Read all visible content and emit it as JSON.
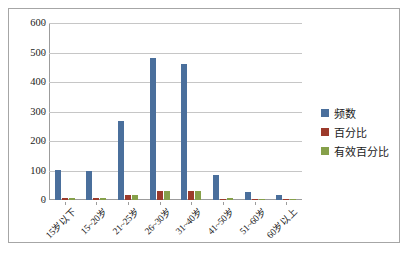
{
  "chart_data": {
    "type": "bar",
    "title": "",
    "subtitle": "",
    "xlabel": "",
    "ylabel": "",
    "ylim": [
      0,
      600
    ],
    "ytick_values": [
      0,
      100,
      200,
      300,
      400,
      500,
      600
    ],
    "ytick_labels": [
      "0",
      "100",
      "200",
      "300",
      "400",
      "500",
      "600"
    ],
    "grid": true,
    "legend_position": "right",
    "categories": [
      "15岁以下",
      "15~20岁",
      "21~25岁",
      "26~30岁",
      "31~40岁",
      "41~50岁",
      "51~60岁",
      "60岁以上"
    ],
    "series": [
      {
        "name": "频数",
        "color": "#4a6f9c",
        "values": [
          103,
          97,
          268,
          482,
          460,
          85,
          27,
          18
        ]
      },
      {
        "name": "百分比",
        "color": "#9c3a2b",
        "values": [
          6,
          6,
          17,
          31,
          30,
          5,
          2,
          1
        ]
      },
      {
        "name": "有效百分比",
        "color": "#86a04a",
        "values": [
          7,
          6,
          18,
          32,
          30,
          6,
          2,
          1
        ]
      }
    ]
  },
  "legend": {
    "items": [
      {
        "label": "频数",
        "color": "#4a6f9c"
      },
      {
        "label": "百分比",
        "color": "#9c3a2b"
      },
      {
        "label": "有效百分比",
        "color": "#86a04a"
      }
    ]
  },
  "colors": {
    "frame_border": "#a6a6a6",
    "gridline": "#c6c6c6",
    "axis": "#9c9c9c",
    "background": "#ffffff",
    "text": "#1a1a1a"
  }
}
